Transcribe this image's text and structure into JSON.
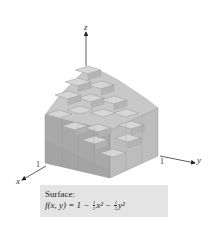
{
  "figure": {
    "type": "3d-surface-step-approximation",
    "axes": {
      "x": {
        "label": "x",
        "tick": "1"
      },
      "y": {
        "label": "y",
        "tick": "1"
      },
      "z": {
        "label": "z"
      }
    },
    "colors": {
      "top_face": "#d2d2d2",
      "left_face": "#a8a8a8",
      "right_face": "#bcbcbc",
      "caption_bg": "#e4e4e4"
    }
  },
  "caption": {
    "title": "Surface:",
    "function_lhs": "f(x, y) = 1 −",
    "half": {
      "num": "1",
      "den": "2"
    },
    "term1": "x²",
    "minus": "−",
    "term2": "y²"
  }
}
